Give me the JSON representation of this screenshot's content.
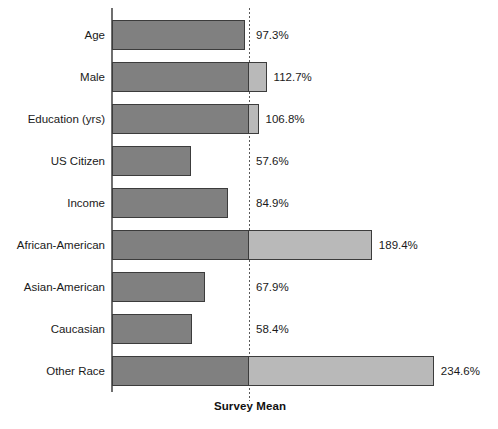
{
  "chart_data": {
    "type": "bar",
    "orientation": "horizontal",
    "title": "",
    "subtitle": "",
    "xlabel": "Survey Mean",
    "ylabel": "",
    "categories": [
      "Age",
      "Male",
      "Education (yrs)",
      "US Citizen",
      "Income",
      "African-American",
      "Asian-American",
      "Caucasian",
      "Other Race"
    ],
    "values": [
      97.3,
      112.7,
      106.8,
      57.6,
      84.9,
      189.4,
      67.9,
      58.4,
      234.6
    ],
    "value_labels": [
      "97.3%",
      "112.7%",
      "106.8%",
      "57.6%",
      "84.9%",
      "189.4%",
      "67.9%",
      "58.4%",
      "234.6%"
    ],
    "unit": "%",
    "reference_line": 100,
    "reference_line_style": "dotted",
    "xlim": [
      0,
      260
    ],
    "grid": false,
    "legend": null,
    "colors": {
      "bar_below_reference": "#808080",
      "bar_above_reference": "#b9b9b9",
      "bar_outline": "#3c3c3c",
      "axis": "#6f6f6f",
      "reference_line": "#5a5a5a",
      "text": "#1a1a1a",
      "background": "#ffffff"
    }
  }
}
